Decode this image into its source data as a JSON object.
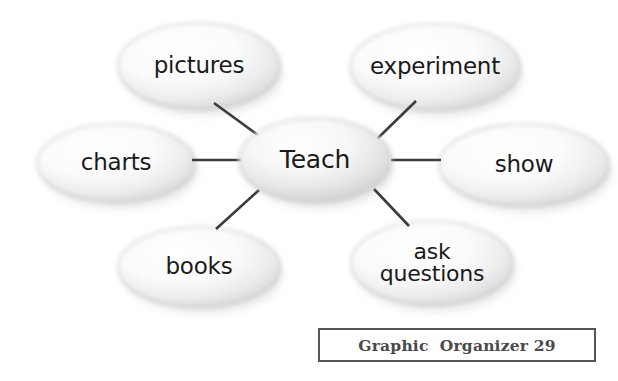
{
  "diagram": {
    "type": "concept-web",
    "center": {
      "label": "Teach",
      "cx": 315,
      "cy": 160,
      "rx": 76,
      "ry": 42,
      "font_size": 25
    },
    "nodes": [
      {
        "id": "pictures",
        "label": "pictures",
        "cx": 199,
        "cy": 66,
        "rx": 81,
        "ry": 43,
        "font_size": 23,
        "lines": [
          "pictures"
        ]
      },
      {
        "id": "experiment",
        "label": "experiment",
        "cx": 435,
        "cy": 67,
        "rx": 85,
        "ry": 43,
        "font_size": 23,
        "lines": [
          "experiment"
        ]
      },
      {
        "id": "charts",
        "label": "charts",
        "cx": 116,
        "cy": 163,
        "rx": 79,
        "ry": 39,
        "font_size": 23,
        "lines": [
          "charts"
        ]
      },
      {
        "id": "show",
        "label": "show",
        "cx": 524,
        "cy": 165,
        "rx": 85,
        "ry": 41,
        "font_size": 23,
        "lines": [
          "show"
        ]
      },
      {
        "id": "books",
        "label": "books",
        "cx": 199,
        "cy": 267,
        "rx": 81,
        "ry": 40,
        "font_size": 23,
        "lines": [
          "books"
        ]
      },
      {
        "id": "ask-questions",
        "label": "ask questions",
        "cx": 432,
        "cy": 263,
        "rx": 81,
        "ry": 42,
        "font_size": 22,
        "lines": [
          "ask",
          "questions"
        ]
      }
    ],
    "connectors": [
      {
        "id": "center-to-pictures",
        "x1": 214,
        "y1": 103,
        "x2": 266,
        "y2": 141
      },
      {
        "id": "center-to-experiment",
        "x1": 416,
        "y1": 101,
        "x2": 377,
        "y2": 139
      },
      {
        "id": "center-to-charts",
        "x1": 192,
        "y1": 160,
        "x2": 241,
        "y2": 160
      },
      {
        "id": "center-to-show",
        "x1": 391,
        "y1": 160,
        "x2": 441,
        "y2": 160
      },
      {
        "id": "center-to-books",
        "x1": 259,
        "y1": 190,
        "x2": 216,
        "y2": 229
      },
      {
        "id": "center-to-ask-questions",
        "x1": 374,
        "y1": 189,
        "x2": 409,
        "y2": 226
      }
    ],
    "connector_color": "#3c3c3c",
    "connector_width": 2.6,
    "oval_outline_color": "#b7b7b7",
    "oval_fill_light": "#ffffff",
    "oval_fill_shade": "#d6d6d6",
    "text_color": "#1a1a1a",
    "background": "#ffffff"
  },
  "caption": {
    "text": "Graphic  Organizer 29",
    "border_color": "#555555",
    "text_color": "#4a4a4a"
  }
}
